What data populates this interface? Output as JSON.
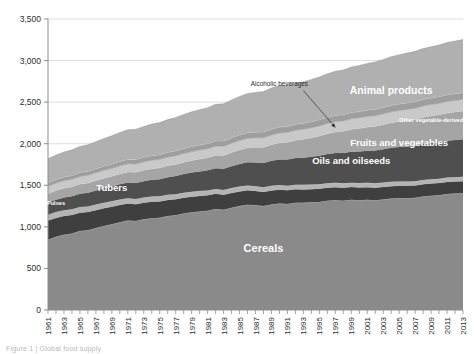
{
  "figure": {
    "caption": "Figure 1 | Global food supply",
    "background": "#ffffff"
  },
  "chart_data": {
    "type": "area",
    "stacked": true,
    "title": "",
    "xlabel": "",
    "ylabel": "",
    "ylim": [
      0,
      3500
    ],
    "ytick_step": 500,
    "grid": true,
    "legend_position": "inline-labels",
    "ytick_labels": [
      "0",
      "500",
      "1,000",
      "1,500",
      "2,000",
      "2,500",
      "3,000",
      "3,500"
    ],
    "ytick_values": [
      0,
      500,
      1000,
      1500,
      2000,
      2500,
      3000,
      3500
    ],
    "x": [
      1961,
      1962,
      1963,
      1964,
      1965,
      1966,
      1967,
      1968,
      1969,
      1970,
      1971,
      1972,
      1973,
      1974,
      1975,
      1976,
      1977,
      1978,
      1979,
      1980,
      1981,
      1982,
      1983,
      1984,
      1985,
      1986,
      1987,
      1988,
      1989,
      1990,
      1991,
      1992,
      1993,
      1994,
      1995,
      1996,
      1997,
      1998,
      1999,
      2000,
      2001,
      2002,
      2003,
      2004,
      2005,
      2006,
      2007,
      2008,
      2009,
      2010,
      2011,
      2012,
      2013
    ],
    "xtick_labels": [
      "1961",
      "1963",
      "1965",
      "1967",
      "1969",
      "1971",
      "1973",
      "1975",
      "1977",
      "1979",
      "1981",
      "1983",
      "1985",
      "1987",
      "1989",
      "1991",
      "1993",
      "1995",
      "1997",
      "1999",
      "2001",
      "2003",
      "2005",
      "2007",
      "2009",
      "2011",
      "2013"
    ],
    "series": [
      {
        "name": "Cereals",
        "label": "Cereals",
        "color": "#8a8a8a",
        "label_color": "#ffffff",
        "values": [
          845,
          880,
          905,
          920,
          950,
          960,
          985,
          1010,
          1030,
          1055,
          1075,
          1070,
          1090,
          1105,
          1110,
          1130,
          1140,
          1160,
          1175,
          1185,
          1195,
          1215,
          1205,
          1230,
          1250,
          1265,
          1260,
          1250,
          1270,
          1280,
          1275,
          1290,
          1290,
          1295,
          1300,
          1315,
          1320,
          1315,
          1325,
          1320,
          1325,
          1320,
          1330,
          1340,
          1345,
          1345,
          1350,
          1365,
          1375,
          1380,
          1395,
          1400,
          1405
        ]
      },
      {
        "name": "Tubers",
        "label": "Tubers",
        "color": "#3f3f3f",
        "label_color": "#ffffff",
        "values": [
          230,
          228,
          226,
          222,
          220,
          218,
          216,
          214,
          212,
          208,
          205,
          202,
          200,
          198,
          196,
          194,
          192,
          190,
          188,
          186,
          184,
          182,
          180,
          178,
          176,
          174,
          172,
          170,
          168,
          166,
          164,
          162,
          160,
          158,
          157,
          156,
          155,
          154,
          153,
          152,
          151,
          150,
          150,
          149,
          148,
          148,
          147,
          147,
          146,
          146,
          145,
          145,
          145
        ]
      },
      {
        "name": "Pulses",
        "label": "Pulses",
        "color": "#b4b4b4",
        "label_color": "#ffffff",
        "values": [
          72,
          71,
          70,
          70,
          69,
          68,
          68,
          67,
          66,
          66,
          65,
          64,
          64,
          63,
          62,
          62,
          61,
          61,
          60,
          60,
          59,
          59,
          58,
          58,
          58,
          57,
          57,
          57,
          56,
          56,
          56,
          55,
          55,
          55,
          55,
          54,
          54,
          54,
          54,
          54,
          54,
          54,
          53,
          53,
          53,
          53,
          53,
          53,
          53,
          53,
          53,
          53,
          53
        ]
      },
      {
        "name": "Oils and oilseeds",
        "label": "Oils and oilseeds",
        "color": "#4f4f4f",
        "label_color": "#ffffff",
        "values": [
          145,
          148,
          152,
          156,
          160,
          164,
          168,
          172,
          176,
          182,
          188,
          192,
          196,
          200,
          206,
          212,
          218,
          224,
          230,
          236,
          242,
          250,
          256,
          264,
          272,
          280,
          286,
          292,
          300,
          308,
          314,
          320,
          326,
          334,
          342,
          350,
          358,
          364,
          372,
          380,
          386,
          394,
          400,
          408,
          414,
          420,
          426,
          432,
          436,
          440,
          444,
          448,
          452
        ]
      },
      {
        "name": "Fruits and vegetables",
        "label": "Fruits and vegetables",
        "color": "#a5a5a5",
        "label_color": "#ffffff",
        "values": [
          108,
          110,
          112,
          114,
          116,
          118,
          120,
          122,
          124,
          126,
          128,
          130,
          132,
          134,
          136,
          138,
          140,
          143,
          146,
          149,
          152,
          156,
          160,
          165,
          170,
          176,
          182,
          188,
          195,
          202,
          208,
          215,
          222,
          230,
          238,
          246,
          254,
          262,
          270,
          278,
          284,
          290,
          296,
          302,
          308,
          313,
          318,
          322,
          326,
          330,
          333,
          336,
          339
        ]
      },
      {
        "name": "Other vegetable-derived",
        "label": "Other vegetable-derived",
        "color": "#c9c9c9",
        "label_color": "#ffffff",
        "values": [
          88,
          89,
          90,
          91,
          92,
          93,
          94,
          95,
          96,
          97,
          98,
          99,
          100,
          101,
          102,
          103,
          104,
          105,
          106,
          107,
          108,
          109,
          110,
          111,
          112,
          113,
          114,
          115,
          116,
          117,
          118,
          119,
          120,
          121,
          122,
          123,
          124,
          125,
          126,
          127,
          128,
          129,
          130,
          131,
          132,
          133,
          134,
          135,
          136,
          137,
          138,
          139,
          140
        ]
      },
      {
        "name": "Alcoholic beverages",
        "label": "Alcoholic beverages",
        "color": "#9e9e9e",
        "label_color": "#2b2b2b",
        "callout": true,
        "values": [
          42,
          43,
          44,
          45,
          46,
          47,
          48,
          49,
          50,
          51,
          52,
          53,
          54,
          55,
          56,
          57,
          58,
          59,
          60,
          61,
          62,
          63,
          64,
          65,
          66,
          67,
          68,
          69,
          70,
          71,
          71,
          72,
          72,
          72,
          73,
          73,
          74,
          74,
          75,
          75,
          76,
          76,
          76,
          77,
          77,
          78,
          78,
          78,
          79,
          79,
          80,
          80,
          80
        ]
      },
      {
        "name": "Animal products",
        "label": "Animal products",
        "color": "#b0b0b0",
        "label_color": "#ffffff",
        "values": [
          290,
          296,
          302,
          308,
          314,
          320,
          326,
          334,
          342,
          350,
          358,
          364,
          372,
          380,
          386,
          394,
          402,
          410,
          418,
          426,
          432,
          440,
          448,
          456,
          464,
          472,
          478,
          486,
          494,
          500,
          498,
          496,
          500,
          508,
          516,
          524,
          532,
          540,
          548,
          556,
          562,
          570,
          578,
          586,
          594,
          600,
          606,
          612,
          616,
          622,
          628,
          634,
          640
        ]
      }
    ],
    "inline_labels": [
      {
        "text": "Cereals",
        "x": 1988,
        "y": 700,
        "size": 11
      },
      {
        "text": "Tubers",
        "x": 1969,
        "y": 1430,
        "size": 9.5
      },
      {
        "text": "Pulses",
        "x": 1962,
        "y": 1265,
        "size": 5.6
      },
      {
        "text": "Oils and oilseeds",
        "x": 1999,
        "y": 1760,
        "size": 9.5
      },
      {
        "text": "Fruits and vegetables",
        "x": 2005,
        "y": 1975,
        "size": 9.5
      },
      {
        "text": "Other vegetable-derived",
        "x": 2009,
        "y": 2265,
        "size": 5.6
      },
      {
        "text": "Animal products",
        "x": 2004,
        "y": 2600,
        "size": 10.5
      }
    ],
    "annotations": [
      {
        "text": "Alcoholic beverages",
        "label_x": 1990,
        "label_y": 2690,
        "arrow_from_x": 1993,
        "arrow_from_y": 2640,
        "arrow_to_x": 1997,
        "arrow_to_y": 2195
      }
    ]
  }
}
